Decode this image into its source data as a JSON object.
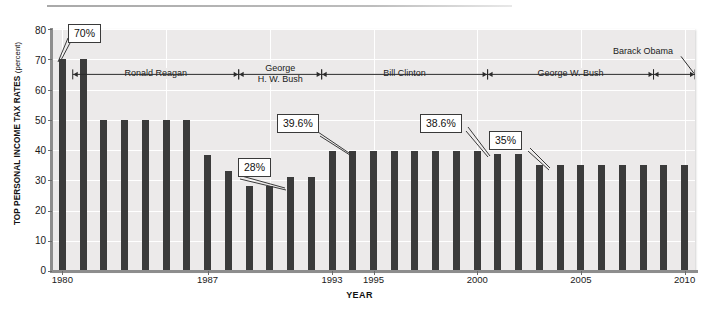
{
  "chart_data": {
    "type": "bar",
    "title": "",
    "xlabel": "YEAR",
    "ylabel": "TOP PERSONAL INCOME TAX RATES",
    "ylabel_unit": "(percent)",
    "ylim": [
      0,
      80
    ],
    "ytick_step": 10,
    "yticks": [
      "80",
      "70",
      "60",
      "50",
      "40",
      "30",
      "20",
      "10",
      "0"
    ],
    "xticks": [
      "1980",
      "1987",
      "1993",
      "1995",
      "2000",
      "2005",
      "2010"
    ],
    "grid": true,
    "legend": "none",
    "bar_color": "#3b3b3b",
    "plot_background": "#eceaea",
    "categories": [
      1980,
      1981,
      1982,
      1983,
      1984,
      1985,
      1986,
      1987,
      1988,
      1989,
      1990,
      1991,
      1992,
      1993,
      1994,
      1995,
      1996,
      1997,
      1998,
      1999,
      2000,
      2001,
      2002,
      2003,
      2004,
      2005,
      2006,
      2007,
      2008,
      2009,
      2010
    ],
    "values": [
      70,
      70,
      50,
      50,
      50,
      50,
      50,
      38.5,
      33,
      28,
      28,
      31,
      31,
      39.6,
      39.6,
      39.6,
      39.6,
      39.6,
      39.6,
      39.6,
      39.6,
      38.6,
      38.6,
      35,
      35,
      35,
      35,
      35,
      35,
      35,
      35
    ],
    "annotations": [
      {
        "label": "70%",
        "year": 1980,
        "value": 70
      },
      {
        "label": "28%",
        "year": 1989,
        "value": 28
      },
      {
        "label": "39.6%",
        "year": 1993,
        "value": 39.6
      },
      {
        "label": "38.6%",
        "year": 2001,
        "value": 38.6
      },
      {
        "label": "35%",
        "year": 2003,
        "value": 35
      }
    ],
    "periods": [
      {
        "name": "Ronald Reagan",
        "start": 1981,
        "end": 1988
      },
      {
        "name": "George\nH. W. Bush",
        "start": 1989,
        "end": 1992
      },
      {
        "name": "Bill Clinton",
        "start": 1993,
        "end": 2000
      },
      {
        "name": "George W. Bush",
        "start": 2001,
        "end": 2008
      },
      {
        "name": "Barack Obama",
        "start": 2009,
        "end": 2010
      }
    ]
  },
  "axis": {
    "y_title_main": "TOP PERSONAL INCOME TAX RATES",
    "y_title_unit": "(percent)",
    "x_title": "YEAR"
  },
  "annotations": {
    "a0": "70%",
    "a1": "28%",
    "a2": "39.6%",
    "a3": "38.6%",
    "a4": "35%"
  },
  "presidents": {
    "reagan": "Ronald Reagan",
    "hwbush_line1": "George",
    "hwbush_line2": "H. W. Bush",
    "clinton": "Bill Clinton",
    "wbush": "George W. Bush",
    "obama": "Barack Obama"
  },
  "yticks": {
    "t0": "80",
    "t1": "70",
    "t2": "60",
    "t3": "50",
    "t4": "40",
    "t5": "30",
    "t6": "20",
    "t7": "10",
    "t8": "0"
  },
  "xticks": {
    "x0": "1980",
    "x1": "1987",
    "x2": "1993",
    "x3": "1995",
    "x4": "2000",
    "x5": "2005",
    "x6": "2010"
  }
}
